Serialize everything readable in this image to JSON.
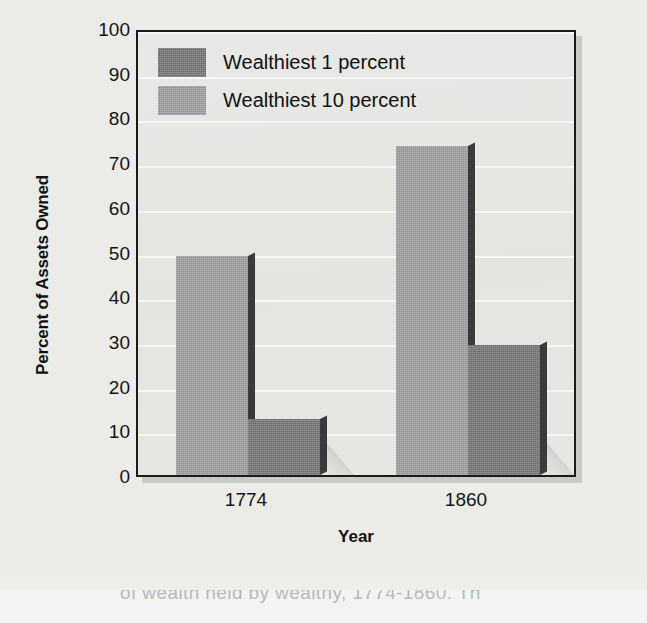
{
  "chart_data": {
    "type": "bar",
    "title": "",
    "subtitle": "",
    "xlabel": "Year",
    "ylabel": "Percent of Assets Owned",
    "categories": [
      "1774",
      "1860"
    ],
    "series": [
      {
        "name": "Wealthiest 1 percent",
        "values": [
          12.5,
          29
        ],
        "color": "#6a6a6a"
      },
      {
        "name": "Wealthiest 10 percent",
        "values": [
          49,
          73.5
        ],
        "color": "#8f8f8f"
      }
    ],
    "bar_draw_order": [
      "Wealthiest 10 percent",
      "Wealthiest 1 percent"
    ],
    "ylim": [
      0,
      100
    ],
    "ytick_values": [
      0,
      10,
      20,
      30,
      40,
      50,
      60,
      70,
      80,
      90,
      100
    ],
    "ytick_labels": [
      "0",
      "10",
      "20",
      "30",
      "40",
      "50",
      "60",
      "70",
      "80",
      "90",
      "100"
    ],
    "grid": true,
    "grid_color": "#f7f7f5",
    "legend_position": "top-left-inside",
    "plot_border_color": "#1a1a1a",
    "plot_background": "#e6e6e3",
    "page_background": "#efefed",
    "style": "grayscale-3d-printed"
  },
  "legend": {
    "entries": [
      {
        "label": "Wealthiest 1 percent",
        "swatch": "#6a6a6a"
      },
      {
        "label": "Wealthiest 10 percent",
        "swatch": "#8f8f8f"
      }
    ]
  },
  "axes": {
    "y_title": "Percent of Assets Owned",
    "x_title": "Year",
    "y_ticks": [
      "100",
      "90",
      "80",
      "70",
      "60",
      "50",
      "40",
      "30",
      "20",
      "10",
      "0"
    ],
    "x_ticks": [
      "1774",
      "1860"
    ]
  },
  "caption": {
    "partial_text": "of wealth held by wealthy, 1774-1860.  Th"
  }
}
